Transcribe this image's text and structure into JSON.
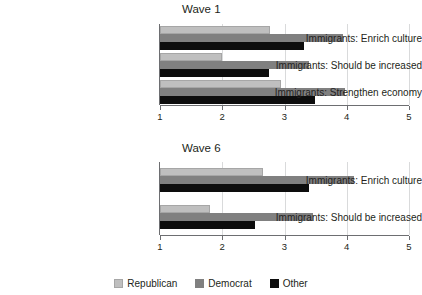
{
  "chart_data": [
    {
      "type": "bar",
      "title": "Wave 1",
      "orientation": "horizontal",
      "categories": [
        "Immigrants: Enrich culture",
        "Immigrants: Should be increased",
        "Immigrants: Strengthen economy"
      ],
      "series": [
        {
          "name": "Republican",
          "color": "#BFBFBF",
          "values": [
            2.77,
            2.0,
            2.94
          ]
        },
        {
          "name": "Democrat",
          "color": "#808080",
          "values": [
            3.94,
            3.39,
            3.97
          ]
        },
        {
          "name": "Other",
          "color": "#0D0D0D",
          "values": [
            3.31,
            2.75,
            3.49
          ]
        }
      ],
      "xlabel": "",
      "ylabel": "",
      "xlim": [
        1,
        5
      ],
      "xticks": [
        "1",
        "2",
        "3",
        "4",
        "5"
      ],
      "grid": true,
      "legend_position": "bottom"
    },
    {
      "type": "bar",
      "title": "Wave 6",
      "orientation": "horizontal",
      "categories": [
        "Immigrants: Enrich culture",
        "Immigrants: Should be increased"
      ],
      "series": [
        {
          "name": "Republican",
          "color": "#BFBFBF",
          "values": [
            2.65,
            1.8
          ]
        },
        {
          "name": "Democrat",
          "color": "#808080",
          "values": [
            4.12,
            3.46
          ]
        },
        {
          "name": "Other",
          "color": "#0D0D0D",
          "values": [
            3.39,
            2.53
          ]
        }
      ],
      "xlabel": "",
      "ylabel": "",
      "xlim": [
        1,
        5
      ],
      "xticks": [
        "1",
        "2",
        "3",
        "4",
        "5"
      ],
      "grid": true,
      "legend_position": "bottom"
    }
  ],
  "legend": {
    "items": [
      {
        "label": "Republican",
        "color": "#BFBFBF"
      },
      {
        "label": "Democrat",
        "color": "#808080"
      },
      {
        "label": "Other",
        "color": "#0D0D0D"
      }
    ]
  }
}
